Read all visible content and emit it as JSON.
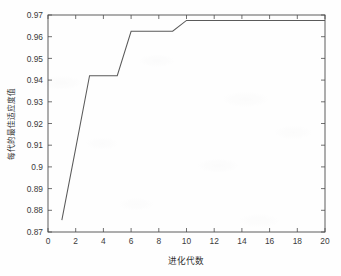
{
  "figure": {
    "background_color": "#fefefe",
    "plot_box": {
      "left": 48,
      "top": 15,
      "right": 325,
      "bottom": 232
    },
    "axis_color": "#4d4d4d",
    "line_color": "#5a5a5a"
  },
  "chart_data": {
    "type": "line",
    "title": "",
    "xlabel": "进化代数",
    "ylabel": "每代的最佳适应度值",
    "xlim": [
      0,
      20
    ],
    "ylim": [
      0.87,
      0.97
    ],
    "xticks": [
      0,
      2,
      4,
      6,
      8,
      10,
      12,
      14,
      16,
      18,
      20
    ],
    "xtick_labels": [
      "0",
      "2",
      "4",
      "6",
      "8",
      "10",
      "12",
      "14",
      "16",
      "18",
      "20"
    ],
    "yticks": [
      0.87,
      0.88,
      0.89,
      0.9,
      0.91,
      0.92,
      0.93,
      0.94,
      0.95,
      0.96,
      0.97
    ],
    "ytick_labels": [
      "0.87",
      "0.88",
      "0.89",
      "0.9",
      "0.91",
      "0.92",
      "0.93",
      "0.94",
      "0.95",
      "0.96",
      "0.97"
    ],
    "grid": false,
    "legend": null,
    "series": [
      {
        "name": "每代的最佳适应度值",
        "color": "#5a5a5a",
        "x": [
          1,
          2,
          3,
          4,
          5,
          6,
          7,
          8,
          9,
          10,
          11,
          12,
          13,
          14,
          15,
          16,
          17,
          18,
          19,
          20
        ],
        "values": [
          0.8755,
          0.9085,
          0.942,
          0.942,
          0.942,
          0.9625,
          0.9625,
          0.9625,
          0.9625,
          0.9675,
          0.9675,
          0.9675,
          0.9675,
          0.9675,
          0.9675,
          0.9675,
          0.9675,
          0.9675,
          0.9675,
          0.9675
        ]
      }
    ]
  }
}
